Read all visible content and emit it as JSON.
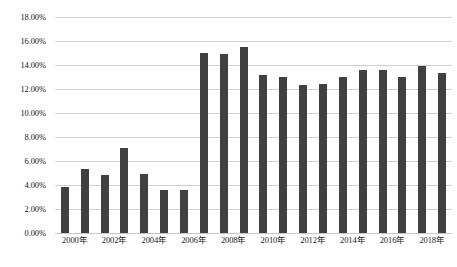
{
  "chart_data": {
    "type": "bar",
    "title": "",
    "subtitle": "",
    "xlabel": "",
    "ylabel": "",
    "categories": [
      "2000年",
      "2001年",
      "2002年",
      "2003年",
      "2004年",
      "2005年",
      "2006年",
      "2007年",
      "2008年",
      "2009年",
      "2010年",
      "2011年",
      "2012年",
      "2013年",
      "2014年",
      "2015年",
      "2016年",
      "2017年",
      "2018年",
      "2019年"
    ],
    "values": [
      3.8,
      5.3,
      4.8,
      7.1,
      4.9,
      3.6,
      3.6,
      15.0,
      14.9,
      15.5,
      13.2,
      13.0,
      12.3,
      12.4,
      13.0,
      13.6,
      13.6,
      13.0,
      13.9,
      13.3
    ],
    "value_suffix": "%",
    "ylim": [
      0,
      18
    ],
    "ytick_values": [
      0,
      2,
      4,
      6,
      8,
      10,
      12,
      14,
      16,
      18
    ],
    "ytick_labels": [
      "0.00%",
      "2.00%",
      "4.00%",
      "6.00%",
      "8.00%",
      "10.00%",
      "12.00%",
      "14.00%",
      "16.00%",
      "18.00%"
    ],
    "xtick_labels_shown": [
      "2000年",
      "2002年",
      "2004年",
      "2006年",
      "2008年",
      "2010年",
      "2012年",
      "2014年",
      "2016年",
      "2018年"
    ],
    "xtick_label_interval": 2,
    "grid": true,
    "grid_axis": "y",
    "legend": false,
    "legend_position": "none",
    "colors": {
      "bar": "#404040",
      "gridline": "#d0d0d0",
      "background": "#ffffff",
      "text": "#1a1a1a"
    }
  }
}
